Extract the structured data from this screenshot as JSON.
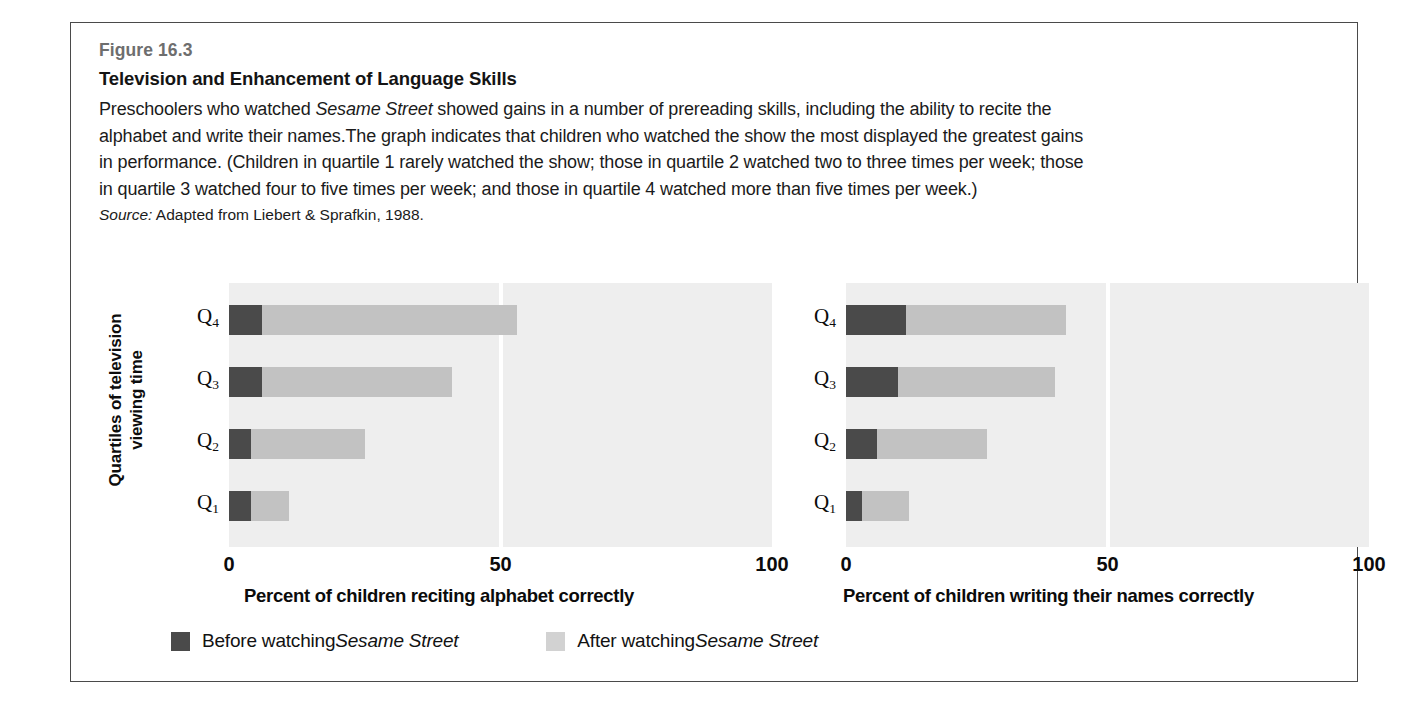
{
  "figure": {
    "number": "Figure 16.3",
    "title": "Television and Enhancement of Language Skills",
    "description_parts": {
      "p1": "Preschoolers who watched ",
      "italic1": "Sesame Street",
      "p2": " showed gains in a number of prereading skills, including the ability to recite the alphabet and write their names.The graph indicates that children who watched the show the most displayed the greatest gains in performance. (Children in quartile 1 rarely watched the show; those in quartile 2 watched two to three times per week; those in quartile 3 watched four to five times per week; and those in quartile 4 watched more than five times per week.)"
    },
    "source_label": "Source:",
    "source_text": " Adapted from Liebert & Sprafkin, 1988."
  },
  "axis": {
    "y_title": "Quartiles of television viewing time"
  },
  "legend": {
    "before": {
      "text_plain": "Before watching ",
      "text_italic": "Sesame Street",
      "color": "#4a4a4a"
    },
    "after": {
      "text_plain": "After watching ",
      "text_italic": "Sesame Street",
      "color": "#d2d2d2"
    }
  },
  "chart_data": [
    {
      "type": "bar",
      "orientation": "horizontal",
      "stacked": true,
      "panel": "left",
      "title": "",
      "xlabel": "Percent of children reciting alphabet correctly",
      "ylabel": "Quartiles of television viewing time",
      "categories": [
        "Q4",
        "Q3",
        "Q2",
        "Q1"
      ],
      "category_labels_main": [
        "Q",
        "Q",
        "Q",
        "Q"
      ],
      "category_labels_sub": [
        "4",
        "3",
        "2",
        "1"
      ],
      "xlim": [
        0,
        100
      ],
      "xticks": [
        0,
        50,
        100
      ],
      "xticklabels": [
        "0",
        "50",
        "100"
      ],
      "grid": "single white vertical line at 50",
      "legend_position": "bottom-left outside",
      "series": [
        {
          "name": "Before watching Sesame Street",
          "color": "#4a4a4a",
          "values": [
            6,
            6,
            4,
            4
          ]
        },
        {
          "name": "After watching Sesame Street",
          "color": "#c2c2c2",
          "values": [
            47,
            35,
            21,
            7
          ]
        }
      ],
      "totals": [
        53,
        41,
        25,
        11
      ]
    },
    {
      "type": "bar",
      "orientation": "horizontal",
      "stacked": true,
      "panel": "right",
      "title": "",
      "xlabel": "Percent of children writing their names correctly",
      "ylabel": "Quartiles of television viewing time",
      "categories": [
        "Q4",
        "Q3",
        "Q2",
        "Q1"
      ],
      "category_labels_main": [
        "Q",
        "Q",
        "Q",
        "Q"
      ],
      "category_labels_sub": [
        "4",
        "3",
        "2",
        "1"
      ],
      "xlim": [
        0,
        100
      ],
      "xticks": [
        0,
        50,
        100
      ],
      "xticklabels": [
        "0",
        "50",
        "100"
      ],
      "grid": "single white vertical line at 50",
      "legend_position": "bottom-left outside",
      "series": [
        {
          "name": "Before watching Sesame Street",
          "color": "#4a4a4a",
          "values": [
            11.5,
            10,
            6,
            3
          ]
        },
        {
          "name": "After watching Sesame Street",
          "color": "#c2c2c2",
          "values": [
            30.5,
            30,
            21,
            9
          ]
        }
      ],
      "totals": [
        42,
        40,
        27,
        12
      ]
    }
  ]
}
